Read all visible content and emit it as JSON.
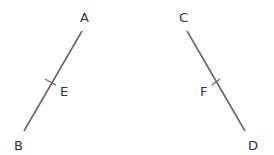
{
  "diagram": {
    "segments": [
      {
        "name": "AB",
        "start_label": "A",
        "end_label": "B",
        "midpoint_label": "E"
      },
      {
        "name": "CD",
        "start_label": "C",
        "end_label": "D",
        "midpoint_label": "F"
      }
    ],
    "line_color": "#666666"
  }
}
